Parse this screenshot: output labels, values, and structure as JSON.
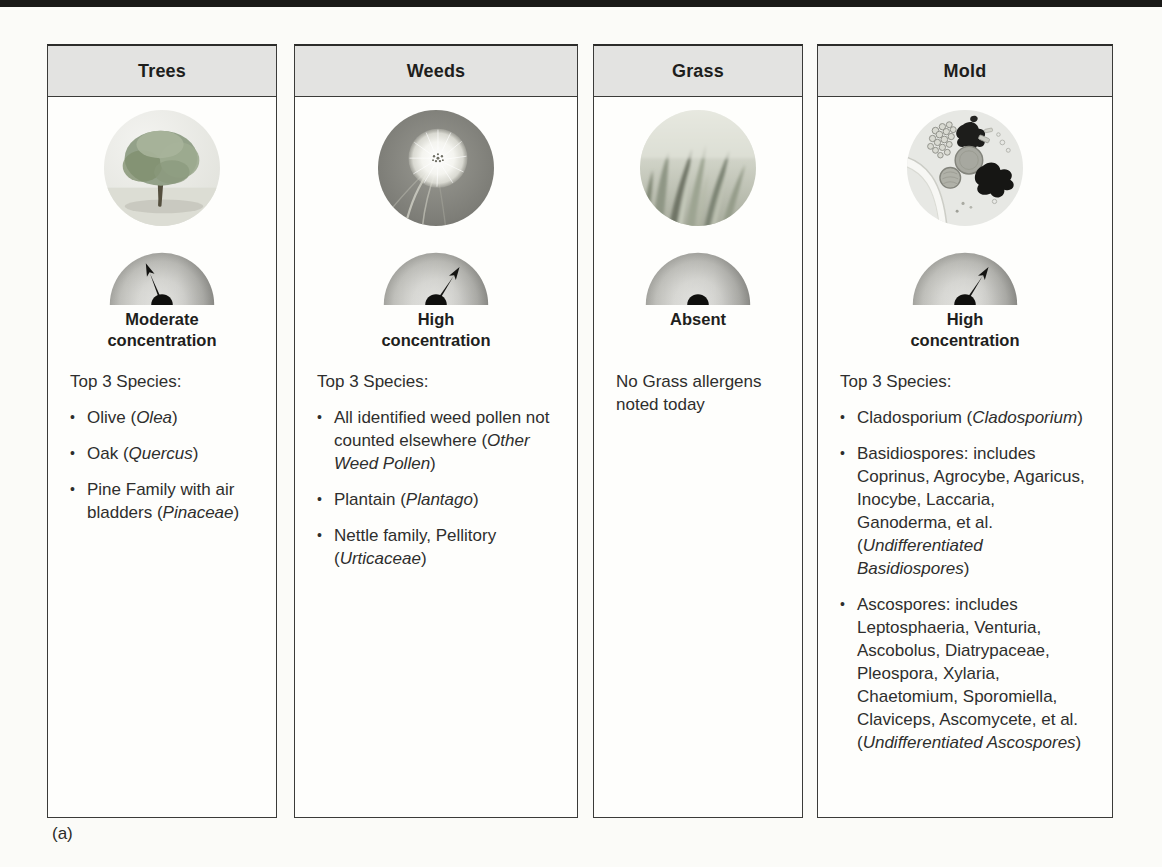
{
  "figure_label": "(a)",
  "ui": {
    "bullet": "•"
  },
  "colors": {
    "card_border": "#3b3b39",
    "header_bg": "#e3e3e1",
    "body_text": "#2e2e2d",
    "needle": "#141412",
    "dial_light": "#ebebe8",
    "dial_dark": "#a2a29d"
  },
  "cards": [
    {
      "title": "Trees",
      "photo": "tree",
      "gauge": {
        "level": "moderate",
        "has_needle": true,
        "needle_deg": -22
      },
      "status": "Moderate\nconcentration",
      "list_header": "Top 3 Species:",
      "items": [
        [
          {
            "t": "Olive ("
          },
          {
            "t": "Olea",
            "i": true
          },
          {
            "t": ")"
          }
        ],
        [
          {
            "t": "Oak ("
          },
          {
            "t": "Quercus",
            "i": true
          },
          {
            "t": ")"
          }
        ],
        [
          {
            "t": "Pine Family with air bladders ("
          },
          {
            "t": "Pinaceae",
            "i": true
          },
          {
            "t": ")"
          }
        ]
      ]
    },
    {
      "title": "Weeds",
      "photo": "dandelion",
      "gauge": {
        "level": "high",
        "has_needle": true,
        "needle_deg": 33
      },
      "status": "High\nconcentration",
      "list_header": "Top 3 Species:",
      "items": [
        [
          {
            "t": "All identified weed pollen not counted elsewhere ("
          },
          {
            "t": "Other Weed Pollen",
            "i": true
          },
          {
            "t": ")"
          }
        ],
        [
          {
            "t": "Plantain ("
          },
          {
            "t": "Plantago",
            "i": true
          },
          {
            "t": ")"
          }
        ],
        [
          {
            "t": "Nettle family, Pellitory ("
          },
          {
            "t": "Urticaceae",
            "i": true
          },
          {
            "t": ")"
          }
        ]
      ]
    },
    {
      "title": "Grass",
      "photo": "grass",
      "gauge": {
        "level": "absent",
        "has_needle": false,
        "needle_deg": 0
      },
      "status": "Absent",
      "note": "No Grass allergens noted today"
    },
    {
      "title": "Mold",
      "photo": "mold",
      "gauge": {
        "level": "high",
        "has_needle": true,
        "needle_deg": 33
      },
      "status": "High\nconcentration",
      "list_header": "Top 3 Species:",
      "items": [
        [
          {
            "t": "Cladosporium ("
          },
          {
            "t": "Cladosporium",
            "i": true
          },
          {
            "t": ")"
          }
        ],
        [
          {
            "t": "Basidiospores: includes Coprinus, Agrocybe, Agaricus, Inocybe, Laccaria, Ganoderma, et al. ("
          },
          {
            "t": "Undifferentiated Basidiospores",
            "i": true
          },
          {
            "t": ")"
          }
        ],
        [
          {
            "t": "Ascospores: includes Leptosphaeria, Venturia, Ascobolus, Diatrypaceae, Pleospora, Xylaria, Chaetomium, Sporomiella, Claviceps, Ascomycete, et al. ("
          },
          {
            "t": "Undifferentiated Ascospores",
            "i": true
          },
          {
            "t": ")"
          }
        ]
      ]
    }
  ]
}
